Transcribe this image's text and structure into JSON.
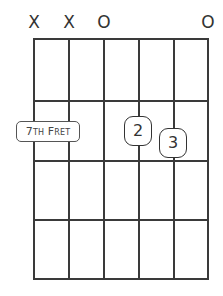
{
  "chord_diagram": {
    "strings": 6,
    "frets_shown": 4,
    "string_markers": [
      "X",
      "X",
      "O",
      "",
      "",
      "O"
    ],
    "position_label": {
      "number": "7",
      "suffix": "TH",
      "word_initial": "F",
      "word_rest": "RET",
      "full_text": "7th Fret"
    },
    "fingers": [
      {
        "label": "2",
        "string": 4,
        "fret": 1
      },
      {
        "label": "3",
        "string": 5,
        "fret": 1
      }
    ],
    "colors": {
      "lines": "#3a3a3a",
      "text": "#333333",
      "background": "#ffffff"
    }
  }
}
